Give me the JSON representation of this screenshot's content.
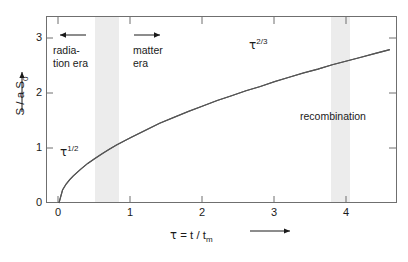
{
  "chart_data": {
    "type": "line",
    "title": "",
    "xlabel": "τ = t / t_m",
    "ylabel": "S / a S_0",
    "xlim": [
      -0.18,
      4.7
    ],
    "ylim": [
      0,
      3.45
    ],
    "grid": false,
    "legend": "none",
    "x_ticks": [
      "0",
      "1",
      "2",
      "3",
      "4"
    ],
    "x_tick_values": [
      0,
      1,
      2,
      3,
      4
    ],
    "y_ticks": [
      "0",
      "1",
      "2",
      "3"
    ],
    "y_tick_values": [
      0,
      1,
      2,
      3
    ],
    "series": [
      {
        "name": "scale factor S/aS0",
        "x": [
          0,
          0.05,
          0.1,
          0.15,
          0.2,
          0.3,
          0.4,
          0.5,
          0.6,
          0.7,
          0.8,
          0.9,
          1.0,
          1.2,
          1.4,
          1.6,
          1.8,
          2.0,
          2.2,
          2.4,
          2.6,
          2.8,
          3.0,
          3.2,
          3.4,
          3.6,
          3.8,
          4.0,
          4.2,
          4.4,
          4.6
        ],
        "values": [
          0,
          0.24,
          0.35,
          0.43,
          0.5,
          0.62,
          0.73,
          0.82,
          0.91,
          0.99,
          1.07,
          1.14,
          1.21,
          1.34,
          1.47,
          1.58,
          1.69,
          1.79,
          1.89,
          1.98,
          2.07,
          2.15,
          2.24,
          2.32,
          2.4,
          2.47,
          2.55,
          2.62,
          2.69,
          2.76,
          2.83
        ]
      }
    ],
    "annotations": [
      {
        "name": "radiation-era-power-law",
        "text": "τ",
        "exponent": "1/2",
        "x": 0.2,
        "y": 0.95
      },
      {
        "name": "matter-era-power-law",
        "text": "τ",
        "exponent": "2/3",
        "x": 2.65,
        "y": 2.9
      },
      {
        "name": "recombination-region",
        "text": "recombination",
        "x": 3.95,
        "y": 1.55
      }
    ],
    "shaded_bands": [
      {
        "name": "radiation-matter-transition",
        "x_start": 0.5,
        "x_end": 0.83,
        "color": "#ececec"
      },
      {
        "name": "recombination",
        "x_start": 3.78,
        "x_end": 4.05,
        "color": "#ececec"
      }
    ]
  },
  "axes": {
    "y_title_main": "S / a S",
    "y_title_sub": "0",
    "x_title_tau": "τ",
    "x_title_eq": " = t / t",
    "x_title_sub": "m",
    "x_tick_labels": [
      "0",
      "1",
      "2",
      "3",
      "4"
    ],
    "y_tick_labels": [
      "3",
      "2",
      "1",
      "0"
    ]
  },
  "labels": {
    "radiation_era_line1": "radia-",
    "radiation_era_line2": "tion era",
    "matter_era_line1": "matter",
    "matter_era_line2": "era",
    "recombination": "recombination",
    "tau_half_base": "τ",
    "tau_half_exp": "1/2",
    "tau_twothirds_base": "τ",
    "tau_twothirds_exp": "2/3"
  },
  "colors": {
    "axis": "#6f6f6f",
    "curve": "#555555",
    "band": "#ececec",
    "text": "#1a1a1a",
    "background": "#ffffff"
  }
}
